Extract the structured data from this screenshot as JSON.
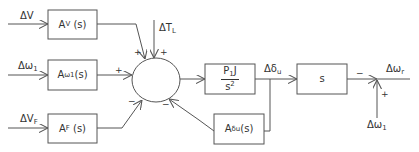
{
  "diagram": {
    "type": "block-diagram",
    "line_color": "#555555",
    "inputs": {
      "dV": {
        "main": "ΔV",
        "sub": ""
      },
      "dw1_left": {
        "main": "Δω",
        "sub": "1"
      },
      "dVF": {
        "main": "ΔV",
        "sub": "F"
      },
      "dTL": {
        "main": "ΔT",
        "sub": "L"
      },
      "dw1_bottom": {
        "main": "Δω",
        "sub": "1"
      }
    },
    "blocks": {
      "av": {
        "main": "A",
        "sub": "V",
        "suffix": " (s)"
      },
      "aw1": {
        "main": "A",
        "sub": "ω1",
        "suffix": "(s)"
      },
      "af": {
        "main": "A",
        "sub": "F",
        "suffix": " (s)"
      },
      "plant": {
        "numerator": "P",
        "num_sub": "1",
        "num_suffix": "J",
        "denominator": "s",
        "den_sup": "2"
      },
      "adu": {
        "main": "A",
        "sub": "δu",
        "suffix": "(s)"
      },
      "s": {
        "label": "s"
      }
    },
    "signals": {
      "ddu": {
        "main": "Δδ",
        "sub": "u"
      },
      "dwr": {
        "main": "Δω",
        "sub": "r"
      }
    },
    "signs": {
      "sum_av": "+",
      "sum_tl": "+",
      "sum_aw1": "+",
      "sum_af": "−",
      "sum_adu": "−",
      "out_s": "−",
      "out_w1": "+"
    }
  }
}
